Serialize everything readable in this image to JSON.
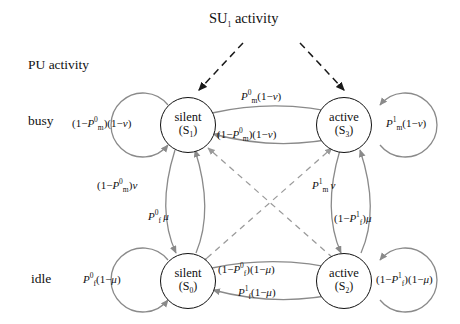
{
  "diagram": {
    "title_top": "SU1 activity",
    "title_top_parts": {
      "base": "SU",
      "sub": "1",
      "rest": " activity"
    },
    "axis_label": "PU activity",
    "row_labels": {
      "busy": "busy",
      "idle": "idle"
    },
    "nodes": [
      {
        "key": "S1",
        "name": "silent",
        "id": "(S1)",
        "id_base": "(S",
        "id_sub": "1",
        "id_tail": ")",
        "row": "busy",
        "col": "left"
      },
      {
        "key": "S3",
        "name": "active",
        "id": "(S3)",
        "id_base": "(S",
        "id_sub": "3",
        "id_tail": ")",
        "row": "busy",
        "col": "right"
      },
      {
        "key": "S0",
        "name": "silent",
        "id": "(S0)",
        "id_base": "(S",
        "id_sub": "0",
        "id_tail": ")",
        "row": "idle",
        "col": "left"
      },
      {
        "key": "S2",
        "name": "active",
        "id": "(S2)",
        "id_base": "(S",
        "id_sub": "2",
        "id_tail": ")",
        "row": "idle",
        "col": "right"
      }
    ],
    "edge_labels": {
      "s1_self": "(1 − Pm0)(1 − v)",
      "s3_self": "Pm1(1 − v)",
      "s0_self": "Pf0(1 − μ)",
      "s2_self": "(1 − Pf1)(1 − μ)",
      "s1_to_s3": "Pm0(1 − v)",
      "s3_to_s1": "(1 − Pm0)(1 − v)",
      "s0_to_s2": "(1 − Pf0)(1 − μ)",
      "s2_to_s0": "Pf1(1 − μ)",
      "s1_to_s0": "(1 − Pm0)v",
      "s0_to_s1": "Pf0 μ",
      "s3_to_s2": "Pm1 v",
      "s2_to_s3": "(1 − Pf1)μ"
    },
    "colors": {
      "node_stroke": "#111111",
      "solid_edge": "#8a8a8a",
      "dashed_edge": "#9a9a9a",
      "su_arrow": "#1a1a1a",
      "text": "#111111",
      "background": "#ffffff"
    }
  }
}
